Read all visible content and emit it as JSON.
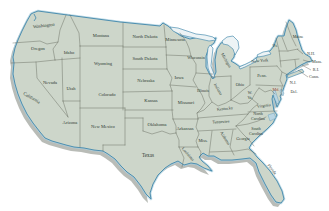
{
  "map": {
    "description": "Map of the contiguous United States with state name labels",
    "colors": {
      "land": "#cdd6ca",
      "shadow": "#b9bcb7",
      "coast": "#4e8fb0",
      "glow": "#aacfdf",
      "lake": "#edf3f5",
      "bay": "#b9d5e3",
      "border": "#5f6458",
      "label": "#2f3b33",
      "maryland_label": "#9a4632"
    },
    "labels": [
      {
        "id": "washington",
        "lines": [
          "Washington"
        ],
        "x": 44,
        "y": 27,
        "rot": -6
      },
      {
        "id": "oregon",
        "lines": [
          "Oregon"
        ],
        "x": 38,
        "y": 50,
        "rot": 0
      },
      {
        "id": "california",
        "lines": [
          "California"
        ],
        "x": 31,
        "y": 99,
        "rot": 30
      },
      {
        "id": "nevada",
        "lines": [
          "Nevada"
        ],
        "x": 50,
        "y": 84,
        "rot": 0
      },
      {
        "id": "idaho",
        "lines": [
          "Idaho"
        ],
        "x": 69,
        "y": 54,
        "rot": 0
      },
      {
        "id": "montana",
        "lines": [
          "Montana"
        ],
        "x": 101,
        "y": 37,
        "rot": 0
      },
      {
        "id": "wyoming",
        "lines": [
          "Wyoming"
        ],
        "x": 103,
        "y": 65,
        "rot": 0
      },
      {
        "id": "utah",
        "lines": [
          "Utah"
        ],
        "x": 71,
        "y": 90,
        "rot": 0
      },
      {
        "id": "colorado",
        "lines": [
          "Colorado"
        ],
        "x": 107,
        "y": 96,
        "rot": 0
      },
      {
        "id": "arizona",
        "lines": [
          "Arizona"
        ],
        "x": 70,
        "y": 124,
        "rot": 0
      },
      {
        "id": "new-mexico",
        "lines": [
          "New Mexico"
        ],
        "x": 103,
        "y": 128,
        "rot": 0
      },
      {
        "id": "north-dakota",
        "lines": [
          "North Dakota"
        ],
        "x": 145,
        "y": 38,
        "rot": 0
      },
      {
        "id": "south-dakota",
        "lines": [
          "South Dakota"
        ],
        "x": 145,
        "y": 60,
        "rot": 0
      },
      {
        "id": "nebraska",
        "lines": [
          "Nebraska"
        ],
        "x": 146,
        "y": 82,
        "rot": 0
      },
      {
        "id": "kansas",
        "lines": [
          "Kansas"
        ],
        "x": 151,
        "y": 102,
        "rot": 0
      },
      {
        "id": "oklahoma",
        "lines": [
          "Oklahoma"
        ],
        "x": 157,
        "y": 126,
        "rot": 0
      },
      {
        "id": "texas",
        "lines": [
          "Texas"
        ],
        "x": 148,
        "y": 157,
        "rot": 0,
        "size": 5.2
      },
      {
        "id": "minnesota",
        "lines": [
          "Minnesota"
        ],
        "x": 175,
        "y": 41,
        "rot": 0
      },
      {
        "id": "iowa",
        "lines": [
          "Iowa"
        ],
        "x": 179,
        "y": 79,
        "rot": 0
      },
      {
        "id": "missouri",
        "lines": [
          "Missouri"
        ],
        "x": 186,
        "y": 104,
        "rot": 0
      },
      {
        "id": "arkansas",
        "lines": [
          "Arkansas"
        ],
        "x": 185,
        "y": 130,
        "rot": 0
      },
      {
        "id": "louisiana",
        "lines": [
          "Louisiana"
        ],
        "x": 187,
        "y": 155,
        "rot": 48,
        "size": 4.2
      },
      {
        "id": "wisconsin",
        "lines": [
          "Wisconsin"
        ],
        "x": 196,
        "y": 59,
        "rot": 0,
        "size": 4.2
      },
      {
        "id": "illinois",
        "lines": [
          "Illinois"
        ],
        "x": 203,
        "y": 92,
        "rot": 0,
        "size": 4.2
      },
      {
        "id": "michigan",
        "lines": [
          "Michigan"
        ],
        "x": 225,
        "y": 61,
        "rot": 60,
        "size": 4.2
      },
      {
        "id": "indiana",
        "lines": [
          "Indiana"
        ],
        "x": 217,
        "y": 90,
        "rot": 60,
        "size": 4.2
      },
      {
        "id": "ohio",
        "lines": [
          "Ohio"
        ],
        "x": 240,
        "y": 86,
        "rot": 0,
        "size": 4.2
      },
      {
        "id": "kentucky",
        "lines": [
          "Kentucky"
        ],
        "x": 225,
        "y": 110,
        "rot": -6,
        "size": 4.2
      },
      {
        "id": "tennessee",
        "lines": [
          "Tennessee"
        ],
        "x": 221,
        "y": 123,
        "rot": -4,
        "size": 4.2
      },
      {
        "id": "mississippi",
        "lines": [
          "Miss."
        ],
        "x": 203,
        "y": 142,
        "rot": 0,
        "size": 4.2
      },
      {
        "id": "alabama",
        "lines": [
          "Alabama"
        ],
        "x": 224,
        "y": 139,
        "rot": 58,
        "size": 4.2
      },
      {
        "id": "georgia",
        "lines": [
          "Georgia"
        ],
        "x": 243,
        "y": 140,
        "rot": 0,
        "size": 4.2
      },
      {
        "id": "florida",
        "lines": [
          "Florida"
        ],
        "x": 271,
        "y": 170,
        "rot": 52,
        "size": 4.2
      },
      {
        "id": "west-virginia",
        "lines": [
          "W.",
          "Va."
        ],
        "x": 250,
        "y": 94,
        "rot": 0,
        "size": 4.0
      },
      {
        "id": "virginia",
        "lines": [
          "Virginia"
        ],
        "x": 264,
        "y": 107,
        "rot": -8,
        "size": 4.2
      },
      {
        "id": "north-carolina",
        "lines": [
          "North",
          "Carolina"
        ],
        "x": 258,
        "y": 115,
        "rot": 0,
        "size": 4.0
      },
      {
        "id": "south-carolina",
        "lines": [
          "South",
          "Carolina"
        ],
        "x": 256,
        "y": 130,
        "rot": 0,
        "size": 4.0
      },
      {
        "id": "new-york",
        "lines": [
          "New York"
        ],
        "x": 260,
        "y": 62,
        "rot": -5,
        "size": 4.2
      },
      {
        "id": "pennsylvania",
        "lines": [
          "Penn."
        ],
        "x": 262,
        "y": 77,
        "rot": 0,
        "size": 4.2
      },
      {
        "id": "maine",
        "lines": [
          "Maine"
        ],
        "x": 298,
        "y": 38,
        "rot": 0,
        "size": 4.2
      },
      {
        "id": "vermont",
        "lines": [
          "Vt."
        ],
        "x": 275,
        "y": 47,
        "rot": 0,
        "size": 4.0
      },
      {
        "id": "new-hampshire",
        "lines": [
          "N.H."
        ],
        "x": 311,
        "y": 55,
        "rot": 0,
        "size": 4.2
      },
      {
        "id": "massachusetts",
        "lines": [
          "Mass."
        ],
        "x": 317,
        "y": 63,
        "rot": 0,
        "size": 4.2
      },
      {
        "id": "rhode-island",
        "lines": [
          "R.I."
        ],
        "x": 316,
        "y": 71,
        "rot": 0,
        "size": 4.2
      },
      {
        "id": "connecticut",
        "lines": [
          "Conn."
        ],
        "x": 314,
        "y": 78,
        "rot": 0,
        "size": 4.2
      },
      {
        "id": "new-jersey",
        "lines": [
          "N.J."
        ],
        "x": 293,
        "y": 84,
        "rot": 0,
        "size": 4.2
      },
      {
        "id": "delaware",
        "lines": [
          "Del."
        ],
        "x": 294,
        "y": 93,
        "rot": 0,
        "size": 4.2
      },
      {
        "id": "maryland",
        "lines": [
          "Md."
        ],
        "x": 276,
        "y": 91,
        "rot": 0,
        "size": 4.2,
        "color": "#9a4632"
      }
    ]
  }
}
